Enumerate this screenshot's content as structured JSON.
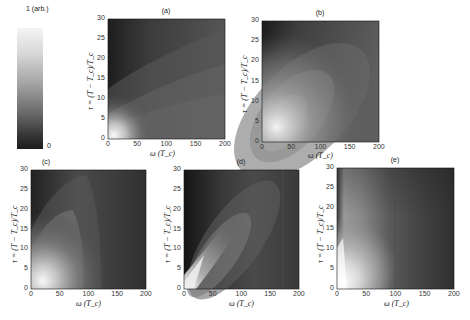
{
  "colorbar": {
    "top_label": "1 (arb.)",
    "bottom_label": "0",
    "colormap": "gray",
    "range": [
      0,
      1
    ]
  },
  "axes_labels": {
    "xlabel": "ω (T_c)",
    "ylabel": "τ = (T − T_c)/T_c"
  },
  "x_ticks": [
    "0",
    "50",
    "100",
    "150",
    "200"
  ],
  "y_ticks": [
    "0",
    "5",
    "10",
    "15",
    "20",
    "25",
    "30"
  ],
  "panels": [
    {
      "label": "(a)"
    },
    {
      "label": "(b)"
    },
    {
      "label": "(c)"
    },
    {
      "label": "(d)"
    },
    {
      "label": "(e)"
    }
  ],
  "chart_data": [
    {
      "type": "heatmap",
      "title": "(a)",
      "xlabel": "ω (T_c)",
      "ylabel": "τ = (T − T_c)/T_c",
      "xlim": [
        0,
        200
      ],
      "ylim": [
        0,
        30
      ],
      "description": "Bright peak near origin (ω≈0–30, τ≈0–5); contour bands fan out along diagonal; mostly mid-dark gray elsewhere, darkest at small ω / large τ",
      "peak": {
        "omega": 10,
        "tau": 1,
        "value": 1.0
      }
    },
    {
      "type": "heatmap",
      "title": "(b)",
      "xlabel": "ω (T_c)",
      "ylabel": "τ = (T − T_c)/T_c",
      "xlim": [
        0,
        200
      ],
      "ylim": [
        0,
        30
      ],
      "description": "Broad elliptical bright lobe centered near ω≈30, τ≈5, extending along diagonal toward ω≈150, τ≈25; dark at small ω, large τ",
      "peak": {
        "omega": 25,
        "tau": 4,
        "value": 1.0
      }
    },
    {
      "type": "heatmap",
      "title": "(c)",
      "xlabel": "ω (T_c)",
      "ylabel": "τ = (T − T_c)/T_c",
      "xlim": [
        0,
        200
      ],
      "ylim": [
        0,
        30
      ],
      "description": "Bright lobe near ω≈20–40, τ≈0–10, extending upward; nearly vertical contour bands for ω>100; dark background",
      "peak": {
        "omega": 20,
        "tau": 3,
        "value": 1.0
      }
    },
    {
      "type": "heatmap",
      "title": "(d)",
      "xlabel": "ω (T_c)",
      "ylabel": "τ = (T − T_c)/T_c",
      "xlim": [
        0,
        200
      ],
      "ylim": [
        0,
        30
      ],
      "description": "Bright narrow ridge along diagonal from origin (ω≈τ·4), elongated lobe up to ω≈100, τ≈25; vertical striations near ω≈170",
      "peak": {
        "omega": 5,
        "tau": 1,
        "value": 1.0
      }
    },
    {
      "type": "heatmap",
      "title": "(e)",
      "xlabel": "ω (T_c)",
      "ylabel": "τ = (T − T_c)/T_c",
      "xlim": [
        0,
        200
      ],
      "ylim": [
        0,
        30
      ],
      "description": "Bright band at low ω (≈0–40) across most τ with peak near τ≈0–15; intensity decreases with ω in nearly vertical bands; dark for ω>100",
      "peak": {
        "omega": 5,
        "tau": 2,
        "value": 1.0
      }
    }
  ]
}
